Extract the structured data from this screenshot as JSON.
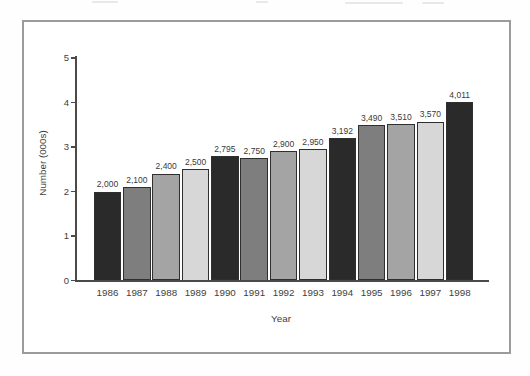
{
  "chart_data": {
    "type": "bar",
    "title": "",
    "categories": [
      "1986",
      "1987",
      "1988",
      "1989",
      "1990",
      "1991",
      "1992",
      "1993",
      "1994",
      "1995",
      "1996",
      "1997",
      "1998"
    ],
    "values": [
      2000,
      2100,
      2400,
      2500,
      2795,
      2750,
      2900,
      2950,
      3192,
      3490,
      3510,
      3570,
      4011
    ],
    "value_labels": [
      "2,000",
      "2,100",
      "2,400",
      "2,500",
      "2,795",
      "2,750",
      "2,900",
      "2,950",
      "3,192",
      "3,490",
      "3,510",
      "3,570",
      "4,011"
    ],
    "xlabel": "Year",
    "ylabel": "Number (000s)",
    "ylim": [
      0,
      5
    ],
    "yticks": [
      0,
      1,
      2,
      3,
      4,
      5
    ],
    "grid": "off",
    "legend": "none",
    "bar_colors_cycle": [
      "#2a2a2a",
      "#7e7e7e",
      "#a4a4a4",
      "#d7d7d7"
    ],
    "bar_border_color": "#2f2f2f",
    "axis_color": "#4a4a4a",
    "text_color": "#3e3e3e",
    "frame_border_color": "#9b9b9b"
  }
}
